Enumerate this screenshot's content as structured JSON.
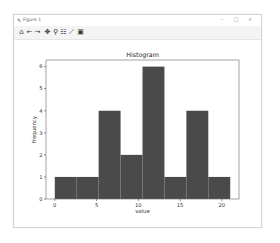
{
  "window": {
    "title": "Figure 1",
    "controls": {
      "minimize": "–",
      "maximize": "□",
      "close": "×"
    }
  },
  "toolbar": {
    "items": [
      {
        "name": "home-icon",
        "glyph": "⌂"
      },
      {
        "name": "back-arrow-icon",
        "glyph": "←"
      },
      {
        "name": "forward-arrow-icon",
        "glyph": "→"
      },
      {
        "name": "pan-move-icon",
        "glyph": "✥"
      },
      {
        "name": "zoom-magnifier-icon",
        "glyph": "⚲"
      },
      {
        "name": "subplots-config-icon",
        "glyph": "☷"
      },
      {
        "name": "edit-axes-icon",
        "glyph": "⟋"
      },
      {
        "name": "save-floppy-icon",
        "glyph": "▣"
      }
    ]
  },
  "colors": {
    "bar": "#4a4a4a",
    "axes": "#555555",
    "text": "#333333"
  },
  "chart_data": {
    "type": "bar",
    "title": "Histogram",
    "xlabel": "value",
    "ylabel": "frequency",
    "bin_edges": [
      0,
      2.625,
      5.25,
      7.875,
      10.5,
      13.125,
      15.75,
      18.375,
      21
    ],
    "values": [
      1,
      1,
      4,
      2,
      6,
      1,
      4,
      1
    ],
    "xticks": [
      0,
      5,
      10,
      15,
      20
    ],
    "yticks": [
      0,
      1,
      2,
      3,
      4,
      5,
      6
    ],
    "xlim": [
      -1.05,
      22.05
    ],
    "ylim": [
      0,
      6.3
    ],
    "grid": false,
    "legend": null
  }
}
